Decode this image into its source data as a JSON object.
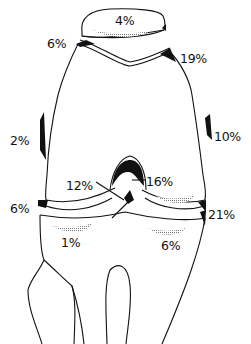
{
  "diagram": {
    "colors": {
      "line": "#111111",
      "background": "#ffffff",
      "hatch": "#888888"
    },
    "labels": {
      "patella": "4%",
      "patella_upper_left": "6%",
      "patella_upper_right": "19%",
      "femur_medial_side": "2%",
      "femur_lateral_side": "10%",
      "intercondylar_left": "12%",
      "intercondylar_right": "16%",
      "joint_line_left": "6%",
      "joint_line_right": "21%",
      "tibia_left_plateau": "1%",
      "tibia_right_plateau": "6%"
    }
  }
}
